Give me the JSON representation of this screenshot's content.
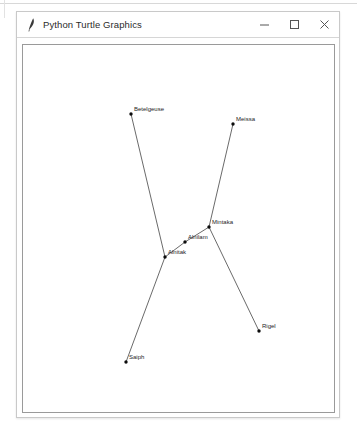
{
  "window": {
    "title": "Python Turtle Graphics",
    "icon": "turtle-pen-icon",
    "controls": {
      "minimize_label": "Minimize",
      "maximize_label": "Maximize",
      "close_label": "Close"
    }
  },
  "canvas": {
    "name": "turtle-drawing-canvas",
    "background_color": "#ffffff",
    "border_color": "#9a9a9a",
    "line_color": "#2a2a2a",
    "star_color": "#0c0c0c",
    "label_color": "#1d1d1d",
    "width": 311,
    "height": 367
  },
  "chart_data": {
    "type": "scatter",
    "xlabel": "",
    "ylabel": "",
    "grid": false,
    "legend": "none",
    "xlim": [
      0,
      311
    ],
    "ylim": [
      0,
      367
    ],
    "points": [
      {
        "name": "Betelgeuse",
        "x": 108,
        "y": 69,
        "label_dx": 3,
        "label_dy": -3
      },
      {
        "name": "Meissa",
        "x": 210,
        "y": 79,
        "label_dx": 3,
        "label_dy": -3
      },
      {
        "name": "Mintaka",
        "x": 186,
        "y": 182,
        "label_dx": 3,
        "label_dy": -3
      },
      {
        "name": "Alnilam",
        "x": 162,
        "y": 197,
        "label_dx": 3,
        "label_dy": -3
      },
      {
        "name": "Alnitak",
        "x": 142,
        "y": 212,
        "label_dx": 3,
        "label_dy": -3
      },
      {
        "name": "Rigel",
        "x": 236,
        "y": 286,
        "label_dx": 3,
        "label_dy": -3
      },
      {
        "name": "Saiph",
        "x": 103,
        "y": 317,
        "label_dx": 3,
        "label_dy": -3
      }
    ],
    "edges": [
      {
        "from": "Betelgeuse",
        "to": "Alnitak"
      },
      {
        "from": "Meissa",
        "to": "Mintaka"
      },
      {
        "from": "Mintaka",
        "to": "Alnilam"
      },
      {
        "from": "Alnilam",
        "to": "Alnitak"
      },
      {
        "from": "Alnitak",
        "to": "Saiph"
      },
      {
        "from": "Mintaka",
        "to": "Rigel"
      }
    ]
  }
}
